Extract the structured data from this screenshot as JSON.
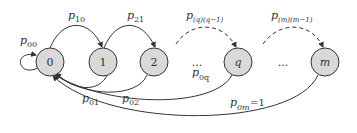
{
  "diagram": {
    "type": "markov-chain",
    "colors": {
      "node_fill": "#d9d9d9",
      "node_stroke": "#333333",
      "edge": "#333333"
    },
    "nodes": [
      {
        "id": "0",
        "label": "0",
        "italic": false
      },
      {
        "id": "1",
        "label": "1",
        "italic": false
      },
      {
        "id": "2",
        "label": "2",
        "italic": false
      },
      {
        "id": "q",
        "label": "q",
        "italic": true
      },
      {
        "id": "m",
        "label": "m",
        "italic": true
      }
    ],
    "ellipses": [
      "...",
      "..."
    ],
    "edges": [
      {
        "from": "0",
        "to": "0",
        "label": "p",
        "sub": "00",
        "style": "solid"
      },
      {
        "from": "0",
        "to": "1",
        "label": "p",
        "sub": "10",
        "style": "solid"
      },
      {
        "from": "1",
        "to": "2",
        "label": "p",
        "sub": "21",
        "style": "solid"
      },
      {
        "from": "...",
        "to": "q",
        "label": "p",
        "sub": "(q)(q−1)",
        "style": "dashed"
      },
      {
        "from": "...",
        "to": "m",
        "label": "p",
        "sub": "(m)(m−1)",
        "style": "dashed"
      },
      {
        "from": "1",
        "to": "0",
        "label": "p",
        "sub": "01",
        "style": "solid"
      },
      {
        "from": "2",
        "to": "0",
        "label": "p",
        "sub": "02",
        "style": "solid"
      },
      {
        "from": "q",
        "to": "0",
        "label": "p",
        "sub": "0q",
        "style": "solid"
      },
      {
        "from": "m",
        "to": "0",
        "label": "p",
        "sub": "0m",
        "suffix": "=1",
        "style": "solid"
      }
    ]
  }
}
